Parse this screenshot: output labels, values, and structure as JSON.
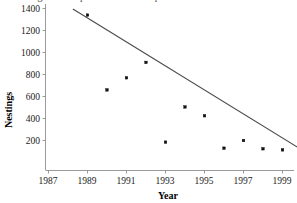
{
  "caption": {
    "text": "drawing the first point and the last point"
  },
  "chart_data": {
    "type": "scatter",
    "title": "",
    "xlabel": "Year",
    "ylabel": "Nestings",
    "xlim": [
      1987,
      2000
    ],
    "ylim": [
      0,
      1450
    ],
    "grid": false,
    "legend": false,
    "xticks": [
      "1987",
      "1989",
      "1991",
      "1993",
      "1995",
      "1997",
      "1999"
    ],
    "xtick_values": [
      1987,
      1989,
      1991,
      1993,
      1995,
      1997,
      1999
    ],
    "yticks": [
      "200",
      "400",
      "600",
      "800",
      "1000",
      "1200",
      "1400"
    ],
    "ytick_values": [
      200,
      400,
      600,
      800,
      1000,
      1200,
      1400
    ],
    "points": [
      {
        "x": 1989,
        "y": 1340
      },
      {
        "x": 1990,
        "y": 660
      },
      {
        "x": 1991,
        "y": 770
      },
      {
        "x": 1992,
        "y": 910
      },
      {
        "x": 1993,
        "y": 185
      },
      {
        "x": 1994,
        "y": 505
      },
      {
        "x": 1995,
        "y": 425
      },
      {
        "x": 1996,
        "y": 130
      },
      {
        "x": 1997,
        "y": 200
      },
      {
        "x": 1998,
        "y": 125
      },
      {
        "x": 1999,
        "y": 115
      }
    ],
    "series": [
      {
        "name": "Nestings",
        "x": [
          1989,
          1990,
          1991,
          1992,
          1993,
          1994,
          1995,
          1996,
          1997,
          1998,
          1999
        ],
        "values": [
          1340,
          660,
          770,
          910,
          185,
          505,
          425,
          130,
          200,
          125,
          115
        ]
      }
    ],
    "fit_line": {
      "type": "line",
      "name": "two-point line",
      "x": [
        1988.25,
        2000.0
      ],
      "y": [
        1395,
        115
      ]
    }
  }
}
